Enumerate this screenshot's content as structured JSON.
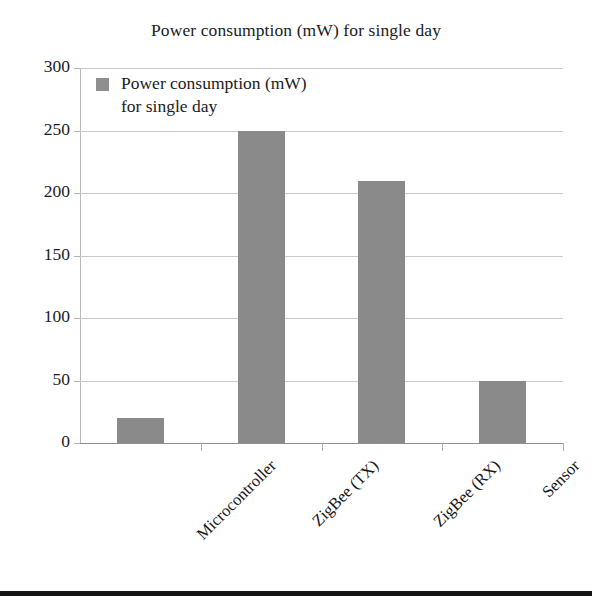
{
  "chart_data": {
    "type": "bar",
    "title": "Power consumption (mW) for single day",
    "xlabel": "",
    "ylabel": "",
    "categories": [
      "Microcontroller",
      "ZigBee (TX)",
      "ZigBee (RX)",
      "Sensor"
    ],
    "values": [
      20,
      250,
      210,
      50
    ],
    "series": [
      {
        "name": "Power consumption (mW) for single day",
        "values": [
          20,
          250,
          210,
          50
        ]
      }
    ],
    "ylim": [
      0,
      300
    ],
    "yticks": [
      0,
      50,
      100,
      150,
      200,
      250,
      300
    ],
    "ytick_labels": [
      "0",
      "50",
      "100",
      "150",
      "200",
      "250",
      "300"
    ],
    "grid": true,
    "grid_axis": "y",
    "legend": {
      "position": "upper-left-inside",
      "entries": [
        {
          "line1": "Power consumption (mW)",
          "line2": "for single day",
          "color": "#8f8f8f"
        }
      ]
    },
    "bar_color": "#8a8a8a",
    "xtick_rotation": 45
  },
  "figure": {
    "title": "Power consumption (mW) for single day",
    "bar_color": "#8a8a8a",
    "grid_color": "#c9c9c9",
    "axis_color": "#9a9a9a",
    "text_color": "#1b1b1b",
    "rule_color": "#141414"
  }
}
